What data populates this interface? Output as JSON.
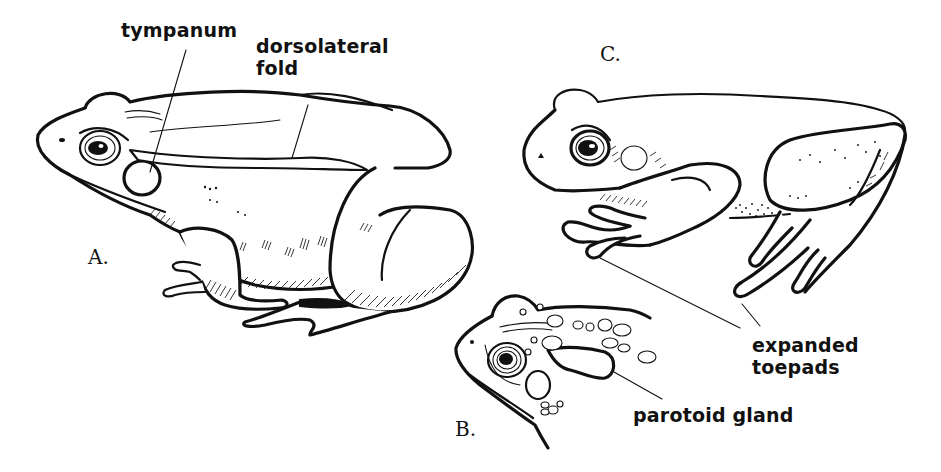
{
  "figure": {
    "panels": [
      {
        "id": "A",
        "letter": "A.",
        "subject": "frog-side-view",
        "labels": [
          {
            "text": "tympanum",
            "lines": [
              "tympanum"
            ]
          },
          {
            "text": "dorsolateral fold",
            "lines": [
              "dorsolateral",
              "fold"
            ]
          }
        ]
      },
      {
        "id": "B",
        "letter": "B.",
        "subject": "toad-head",
        "labels": [
          {
            "text": "parotoid gland",
            "lines": [
              "parotoid gland"
            ]
          }
        ]
      },
      {
        "id": "C",
        "letter": "C.",
        "subject": "treefrog-side-view",
        "labels": [
          {
            "text": "expanded toepads",
            "lines": [
              "expanded",
              "toepads"
            ]
          }
        ]
      }
    ],
    "colors": {
      "ink": "#111111",
      "background": "#ffffff"
    }
  }
}
